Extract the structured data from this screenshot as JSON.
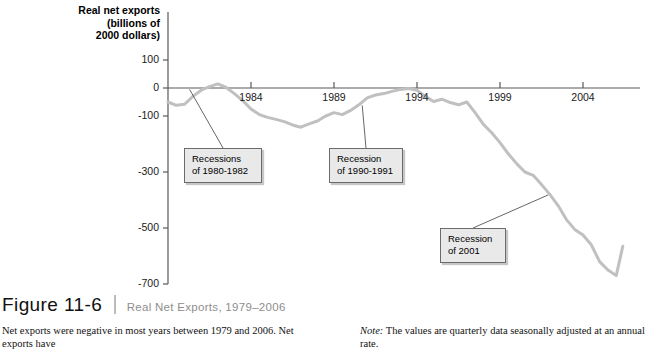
{
  "figure": {
    "number": "Figure 11-6",
    "title": "Real Net Exports, 1979–2006",
    "body_text": "Net exports were negative in most years between 1979 and 2006. Net exports have",
    "note_label": "Note:",
    "note_text": " The values are quarterly data seasonally adjusted at an annual rate."
  },
  "chart_data": {
    "type": "line",
    "title": "Real Net Exports, 1979–2006",
    "xlabel": "",
    "ylabel": "Real net exports\n(billions of\n2000 dollars)",
    "xlim": [
      1979,
      2006.5
    ],
    "ylim": [
      -700,
      100
    ],
    "grid": false,
    "legend": "none",
    "line_color": "#c0c0c0",
    "axis_color": "#595959",
    "xticks": [
      1984,
      1989,
      1994,
      1999,
      2004
    ],
    "xtick_labels": [
      "1984",
      "1989",
      "1994",
      "1999",
      "2004"
    ],
    "yticks": [
      100,
      0,
      -100,
      -300,
      -500,
      -700
    ],
    "ytick_labels": [
      "100",
      "0",
      "-100",
      "-300",
      "-500",
      "-700"
    ],
    "x": [
      1979.0,
      1979.5,
      1980.0,
      1980.5,
      1981.0,
      1981.5,
      1982.0,
      1982.5,
      1983.0,
      1983.5,
      1984.0,
      1984.5,
      1985.0,
      1985.5,
      1986.0,
      1986.5,
      1987.0,
      1987.5,
      1988.0,
      1988.5,
      1989.0,
      1989.5,
      1990.0,
      1990.5,
      1991.0,
      1991.5,
      1992.0,
      1992.5,
      1993.0,
      1993.5,
      1994.0,
      1994.5,
      1995.0,
      1995.5,
      1996.0,
      1996.5,
      1997.0,
      1997.5,
      1998.0,
      1998.5,
      1999.0,
      1999.5,
      2000.0,
      2000.5,
      2001.0,
      2001.5,
      2002.0,
      2002.5,
      2003.0,
      2003.5,
      2004.0,
      2004.5,
      2005.0,
      2005.5,
      2006.0,
      2006.4
    ],
    "values": [
      -50,
      -62,
      -58,
      -30,
      -8,
      5,
      15,
      2,
      -20,
      -45,
      -75,
      -95,
      -105,
      -112,
      -120,
      -132,
      -140,
      -128,
      -118,
      -100,
      -88,
      -95,
      -80,
      -60,
      -35,
      -25,
      -20,
      -12,
      -5,
      -2,
      -8,
      -30,
      -48,
      -40,
      -52,
      -60,
      -50,
      -88,
      -130,
      -160,
      -195,
      -235,
      -270,
      -300,
      -312,
      -345,
      -380,
      -420,
      -470,
      -505,
      -525,
      -560,
      -620,
      -650,
      -670,
      -565
    ],
    "annotations": [
      {
        "label": "Recessions\nof 1980-1982",
        "target_x": 1980.3,
        "target_y": -5
      },
      {
        "label": "Recession\nof 1990-1991",
        "target_x": 1990.7,
        "target_y": -62
      },
      {
        "label": "Recession\nof 2001",
        "target_x": 2001.9,
        "target_y": -382
      }
    ]
  }
}
